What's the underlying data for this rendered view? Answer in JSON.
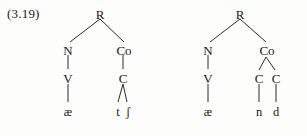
{
  "figure": {
    "example_number": "(3.19)",
    "background_color": "#fdfdfb",
    "line_color": "#2a2a2a",
    "text_color": "#1a1a1a"
  },
  "trees": [
    {
      "id": "tree-left",
      "transcription": "ætʃ",
      "nodes": {
        "root": "R",
        "nucleus": "N",
        "coda": "Co",
        "nucleus_v": "V",
        "coda_c": "C",
        "nucleus_segment": "æ",
        "coda_segment_1": "t",
        "coda_segment_2": "ʃ"
      }
    },
    {
      "id": "tree-right",
      "transcription": "ænd",
      "nodes": {
        "root": "R",
        "nucleus": "N",
        "coda": "Co",
        "nucleus_v": "V",
        "coda_c1": "C",
        "coda_c2": "C",
        "nucleus_segment": "æ",
        "coda_segment_1": "n",
        "coda_segment_2": "d"
      }
    }
  ]
}
